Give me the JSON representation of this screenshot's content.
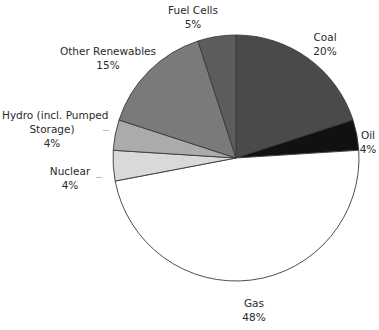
{
  "chart_data": {
    "type": "pie",
    "title": "",
    "start_angle_deg": 0,
    "direction": "clockwise",
    "slices": [
      {
        "label": "Coal",
        "value": 20,
        "value_label": "20%",
        "color": "#4a4a4a"
      },
      {
        "label": "Oil",
        "value": 4,
        "value_label": "4%",
        "color": "#111111"
      },
      {
        "label": "Gas",
        "value": 48,
        "value_label": "48%",
        "color": "#ffffff"
      },
      {
        "label": "Nuclear",
        "value": 4,
        "value_label": "4%",
        "color": "#d9d9d9"
      },
      {
        "label": "Hydro (incl. Pumped Storage)",
        "value": 4,
        "value_label": "4%",
        "color": "#ababab"
      },
      {
        "label": "Other Renewables",
        "value": 15,
        "value_label": "15%",
        "color": "#7a7a7a"
      },
      {
        "label": "Fuel Cells",
        "value": 5,
        "value_label": "5%",
        "color": "#5c5c5c"
      }
    ]
  },
  "labels": {
    "coal": {
      "name": "Coal",
      "pct": "20%"
    },
    "oil": {
      "name": "Oil",
      "pct": "4%"
    },
    "gas": {
      "name": "Gas",
      "pct": "48%"
    },
    "nuclear": {
      "name": "Nuclear",
      "pct": "4%"
    },
    "hydro": {
      "name1": "Hydro (incl. Pumped",
      "name2": "Storage)",
      "pct": "4%"
    },
    "other": {
      "name": "Other Renewables",
      "pct": "15%"
    },
    "fuel": {
      "name": "Fuel Cells",
      "pct": "5%"
    }
  }
}
